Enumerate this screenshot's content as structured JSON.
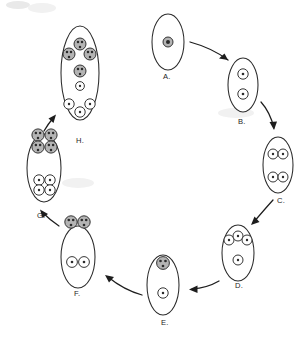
{
  "figure": {
    "width": 308,
    "height": 349,
    "background_color": "#ffffff",
    "outline_color": "#2b2b2b",
    "shaded_fill": "#b4b4b4",
    "open_fill": "#ffffff",
    "arrow_color": "#1d1d1d",
    "arrow_style": "curved-solid-with-filled-head",
    "cycle_direction": "clockwise from A at top, returning to H at upper-left"
  },
  "stages": [
    {
      "id": "A",
      "label": "A.",
      "label_x": 163,
      "label_y": 79,
      "cell": {
        "cx": 168,
        "cy": 42,
        "rx": 16,
        "ry": 28
      },
      "description": "single cell with one shaded nucleus",
      "shaded_count": 1,
      "open_count": 0,
      "nuclei": [
        {
          "cx": 168,
          "cy": 42,
          "r": 5.0,
          "type": "shaded",
          "dots": [
            [
              168,
              42
            ]
          ],
          "dot_r": 2.0
        }
      ]
    },
    {
      "id": "B",
      "label": "B.",
      "label_x": 238,
      "label_y": 124,
      "cell": {
        "cx": 243,
        "cy": 85,
        "rx": 15,
        "ry": 27
      },
      "description": "two open nuclei stacked vertically",
      "shaded_count": 0,
      "open_count": 2,
      "nuclei": [
        {
          "cx": 243,
          "cy": 74,
          "r": 5.2,
          "type": "open",
          "dots": [
            [
              243,
              74
            ]
          ],
          "dot_r": 1.3
        },
        {
          "cx": 243,
          "cy": 94,
          "r": 5.2,
          "type": "open",
          "dots": [
            [
              243,
              94
            ]
          ],
          "dot_r": 1.3
        }
      ]
    },
    {
      "id": "C",
      "label": "C.",
      "label_x": 277,
      "label_y": 203,
      "cell": {
        "cx": 278,
        "cy": 165,
        "rx": 15,
        "ry": 28
      },
      "description": "two pairs of open nuclei, four total",
      "shaded_count": 0,
      "open_count": 4,
      "nuclei": [
        {
          "cx": 273,
          "cy": 154,
          "r": 5.0,
          "type": "open",
          "dots": [
            [
              273,
              154
            ]
          ],
          "dot_r": 1.2
        },
        {
          "cx": 283,
          "cy": 154,
          "r": 5.0,
          "type": "open",
          "dots": [
            [
              283,
              154
            ]
          ],
          "dot_r": 1.2
        },
        {
          "cx": 273,
          "cy": 177,
          "r": 5.0,
          "type": "open",
          "dots": [
            [
              273,
              177
            ]
          ],
          "dot_r": 1.2
        },
        {
          "cx": 283,
          "cy": 177,
          "r": 5.0,
          "type": "open",
          "dots": [
            [
              283,
              177
            ]
          ],
          "dot_r": 1.2
        }
      ]
    },
    {
      "id": "D",
      "label": "D.",
      "label_x": 235,
      "label_y": 288,
      "cell": {
        "cx": 238,
        "cy": 253,
        "rx": 16,
        "ry": 28
      },
      "description": "three open nuclei in an arc above one open nucleus",
      "shaded_count": 0,
      "open_count": 4,
      "nuclei": [
        {
          "cx": 229,
          "cy": 240,
          "r": 5.0,
          "type": "open",
          "dots": [
            [
              229,
              240
            ]
          ],
          "dot_r": 1.2
        },
        {
          "cx": 238,
          "cy": 236,
          "r": 5.0,
          "type": "open",
          "dots": [
            [
              238,
              236
            ]
          ],
          "dot_r": 1.2
        },
        {
          "cx": 247,
          "cy": 240,
          "r": 5.0,
          "type": "open",
          "dots": [
            [
              247,
              240
            ]
          ],
          "dot_r": 1.2
        },
        {
          "cx": 238,
          "cy": 260,
          "r": 5.0,
          "type": "open",
          "dots": [
            [
              238,
              260
            ]
          ],
          "dot_r": 1.2
        }
      ]
    },
    {
      "id": "E",
      "label": "E.",
      "label_x": 161,
      "label_y": 325,
      "cell": {
        "cx": 163,
        "cy": 285,
        "rx": 16,
        "ry": 30
      },
      "description": "one shaded multi-dot nucleus above one open nucleus",
      "shaded_count": 1,
      "open_count": 1,
      "nuclei": [
        {
          "cx": 163,
          "cy": 263,
          "r": 6.4,
          "type": "shaded",
          "dots": [
            [
              160.5,
              261
            ],
            [
              165.5,
              261
            ],
            [
              163,
              266
            ]
          ],
          "dot_r": 1.35
        },
        {
          "cx": 163,
          "cy": 293,
          "r": 5.2,
          "type": "open",
          "dots": [
            [
              163,
              293
            ]
          ],
          "dot_r": 1.25
        }
      ]
    },
    {
      "id": "F",
      "label": "F.",
      "label_x": 74,
      "label_y": 296,
      "cell": {
        "cx": 78,
        "cy": 257,
        "rx": 17,
        "ry": 31
      },
      "description": "two shaded nuclei above two open nuclei",
      "shaded_count": 2,
      "open_count": 2,
      "nuclei": [
        {
          "cx": 71,
          "cy": 222,
          "r": 6.2,
          "type": "shaded",
          "dots": [
            [
              68.8,
              220
            ],
            [
              73.2,
              220
            ],
            [
              71,
              225
            ]
          ],
          "dot_r": 1.3
        },
        {
          "cx": 84,
          "cy": 222,
          "r": 6.2,
          "type": "shaded",
          "dots": [
            [
              81.8,
              220
            ],
            [
              86.2,
              220
            ],
            [
              84,
              225
            ]
          ],
          "dot_r": 1.3
        },
        {
          "cx": 72,
          "cy": 262,
          "r": 5.4,
          "type": "open",
          "dots": [
            [
              72,
              262
            ]
          ],
          "dot_r": 1.3
        },
        {
          "cx": 84,
          "cy": 262,
          "r": 5.4,
          "type": "open",
          "dots": [
            [
              84,
              262
            ]
          ],
          "dot_r": 1.3
        }
      ]
    },
    {
      "id": "G",
      "label": "G.",
      "label_x": 37,
      "label_y": 218,
      "cell": {
        "cx": 44,
        "cy": 168,
        "rx": 17,
        "ry": 34
      },
      "description": "four shaded nuclei in a 2x2 cluster above four open nuclei in a 2x2 cluster",
      "shaded_count": 4,
      "open_count": 4,
      "nuclei": [
        {
          "cx": 38,
          "cy": 135,
          "r": 6.1,
          "type": "shaded",
          "dots": [
            [
              35.9,
              133
            ],
            [
              40.1,
              133
            ],
            [
              38,
              138
            ]
          ],
          "dot_r": 1.25
        },
        {
          "cx": 51,
          "cy": 135,
          "r": 6.1,
          "type": "shaded",
          "dots": [
            [
              48.9,
              133
            ],
            [
              53.1,
              133
            ],
            [
              51,
              138
            ]
          ],
          "dot_r": 1.25
        },
        {
          "cx": 38,
          "cy": 147,
          "r": 6.1,
          "type": "shaded",
          "dots": [
            [
              35.9,
              145
            ],
            [
              40.1,
              145
            ],
            [
              38,
              150
            ]
          ],
          "dot_r": 1.25
        },
        {
          "cx": 51,
          "cy": 147,
          "r": 6.1,
          "type": "shaded",
          "dots": [
            [
              48.9,
              145
            ],
            [
              53.1,
              145
            ],
            [
              51,
              150
            ]
          ],
          "dot_r": 1.25
        },
        {
          "cx": 39,
          "cy": 180,
          "r": 5.2,
          "type": "open",
          "dots": [
            [
              39,
              180
            ]
          ],
          "dot_r": 1.2
        },
        {
          "cx": 50,
          "cy": 180,
          "r": 5.2,
          "type": "open",
          "dots": [
            [
              50,
              180
            ]
          ],
          "dot_r": 1.2
        },
        {
          "cx": 39,
          "cy": 190,
          "r": 5.2,
          "type": "open",
          "dots": [
            [
              39,
              190
            ]
          ],
          "dot_r": 1.2
        },
        {
          "cx": 50,
          "cy": 190,
          "r": 5.2,
          "type": "open",
          "dots": [
            [
              50,
              190
            ]
          ],
          "dot_r": 1.2
        }
      ]
    },
    {
      "id": "H",
      "label": "H.",
      "label_x": 76,
      "label_y": 143,
      "cell": {
        "cx": 80,
        "cy": 73,
        "rx": 19,
        "ry": 47
      },
      "description": "three shaded nuclei in a triangle, one shaded nucleus, one small open nucleus, three open nuclei in an inverted triangle",
      "shaded_count": 4,
      "open_count": 4,
      "nuclei": [
        {
          "cx": 80,
          "cy": 44,
          "r": 6.0,
          "type": "shaded",
          "dots": [
            [
              78,
              42
            ],
            [
              82,
              42
            ],
            [
              80,
              47
            ]
          ],
          "dot_r": 1.25
        },
        {
          "cx": 69,
          "cy": 54,
          "r": 6.0,
          "type": "shaded",
          "dots": [
            [
              67,
              52
            ],
            [
              71,
              52
            ],
            [
              69,
              57
            ]
          ],
          "dot_r": 1.25
        },
        {
          "cx": 90,
          "cy": 54,
          "r": 6.0,
          "type": "shaded",
          "dots": [
            [
              88,
              52
            ],
            [
              92,
              52
            ],
            [
              90,
              57
            ]
          ],
          "dot_r": 1.25
        },
        {
          "cx": 80,
          "cy": 71,
          "r": 6.0,
          "type": "shaded",
          "dots": [
            [
              78,
              69
            ],
            [
              82,
              69
            ],
            [
              80,
              74
            ]
          ],
          "dot_r": 1.25
        },
        {
          "cx": 80,
          "cy": 86,
          "r": 4.4,
          "type": "open",
          "dots": [
            [
              80,
              86
            ]
          ],
          "dot_r": 1.15
        },
        {
          "cx": 69,
          "cy": 104,
          "r": 5.2,
          "type": "open",
          "dots": [
            [
              69,
              104
            ]
          ],
          "dot_r": 1.2
        },
        {
          "cx": 90,
          "cy": 104,
          "r": 5.2,
          "type": "open",
          "dots": [
            [
              90,
              104
            ]
          ],
          "dot_r": 1.2
        },
        {
          "cx": 80,
          "cy": 112,
          "r": 5.2,
          "type": "open",
          "dots": [
            [
              80,
              112
            ]
          ],
          "dot_r": 1.2
        }
      ]
    }
  ],
  "arrows": [
    {
      "id": "A-to-B",
      "from": "A",
      "to": "B",
      "path": "M 190 42 Q 212 48 228 60",
      "head": "M 228 60 L 219 58.5 L 224.5 53.5 Z"
    },
    {
      "id": "B-to-C",
      "from": "B",
      "to": "C",
      "path": "M 261 102 Q 270 112 274 128",
      "head": "M 274 130 L 269.5 122 L 277 121.5 Z"
    },
    {
      "id": "C-to-D",
      "from": "C",
      "to": "D",
      "path": "M 273 200 Q 264 210 253 223",
      "head": "M 251 225 L 254.5 216.5 L 259.5 222 Z"
    },
    {
      "id": "D-to-E",
      "from": "D",
      "to": "E",
      "path": "M 219 281 Q 207 288 192 289",
      "head": "M 189 289.5 L 197.5 285.5 L 197.5 293 Z"
    },
    {
      "id": "E-to-F",
      "from": "E",
      "to": "F",
      "path": "M 142 295 Q 124 290 108 277",
      "head": "M 105 275 L 114 277 L 109 282.5 Z"
    },
    {
      "id": "F-to-G",
      "from": "F",
      "to": "G",
      "path": "M 59 226 Q 50 220 42 212",
      "head": "M 40 209.5 L 48 214 L 42.5 218 Z"
    },
    {
      "id": "G-to-H",
      "from": "G",
      "to": "H",
      "path": "M 44 131 Q 48 124 54 117",
      "head": "M 56 114.5 L 53.5 123 L 48.5 118.5 Z"
    }
  ],
  "legend": {
    "shaded_meaning": "shaded nucleus",
    "open_meaning": "open nucleus"
  }
}
